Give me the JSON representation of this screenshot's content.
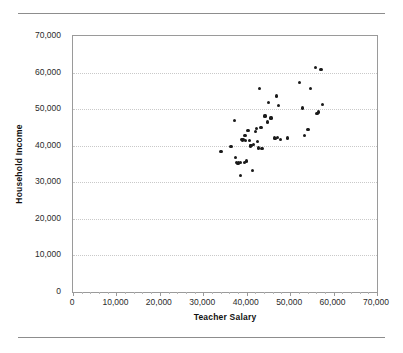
{
  "chart_data": {
    "type": "scatter",
    "title": "",
    "xlabel": "Teacher Salary",
    "ylabel": "Household Income",
    "xlim": [
      0,
      70000
    ],
    "ylim": [
      0,
      70000
    ],
    "xticks": [
      0,
      10000,
      20000,
      30000,
      40000,
      50000,
      60000,
      70000
    ],
    "yticks": [
      0,
      10000,
      20000,
      30000,
      40000,
      50000,
      60000,
      70000
    ],
    "xticklabels": [
      "0",
      "10,000",
      "20,000",
      "30,000",
      "40,000",
      "50,000",
      "60,000",
      "70,000"
    ],
    "yticklabels": [
      "0",
      "10,000",
      "20,000",
      "30,000",
      "40,000",
      "50,000",
      "60,000",
      "70,000"
    ],
    "grid": "horizontal-dotted",
    "legend": null,
    "marker_color": "#1a1a1a",
    "points": [
      {
        "x": 34100,
        "y": 38400
      },
      {
        "x": 36400,
        "y": 39700
      },
      {
        "x": 37100,
        "y": 47000
      },
      {
        "x": 37500,
        "y": 36700
      },
      {
        "x": 37600,
        "y": 35400
      },
      {
        "x": 38000,
        "y": 35200
      },
      {
        "x": 38200,
        "y": 35300
      },
      {
        "x": 38500,
        "y": 35300
      },
      {
        "x": 38600,
        "y": 31800
      },
      {
        "x": 38900,
        "y": 41600
      },
      {
        "x": 39100,
        "y": 41400
      },
      {
        "x": 39300,
        "y": 41700
      },
      {
        "x": 39400,
        "y": 35300
      },
      {
        "x": 39600,
        "y": 42900
      },
      {
        "x": 39800,
        "y": 41500
      },
      {
        "x": 40000,
        "y": 35800
      },
      {
        "x": 40300,
        "y": 44200
      },
      {
        "x": 40600,
        "y": 41400
      },
      {
        "x": 40800,
        "y": 39900
      },
      {
        "x": 41000,
        "y": 40100
      },
      {
        "x": 41300,
        "y": 33200
      },
      {
        "x": 41600,
        "y": 40300
      },
      {
        "x": 42000,
        "y": 43900
      },
      {
        "x": 42300,
        "y": 44700
      },
      {
        "x": 42500,
        "y": 41100
      },
      {
        "x": 42700,
        "y": 39400
      },
      {
        "x": 43000,
        "y": 55600
      },
      {
        "x": 43300,
        "y": 44900
      },
      {
        "x": 43500,
        "y": 39300
      },
      {
        "x": 44200,
        "y": 48100
      },
      {
        "x": 44700,
        "y": 46500
      },
      {
        "x": 45100,
        "y": 51800
      },
      {
        "x": 45600,
        "y": 47600
      },
      {
        "x": 46400,
        "y": 42100
      },
      {
        "x": 46700,
        "y": 41900
      },
      {
        "x": 46900,
        "y": 53600
      },
      {
        "x": 47100,
        "y": 42300
      },
      {
        "x": 47400,
        "y": 50900
      },
      {
        "x": 47800,
        "y": 41800
      },
      {
        "x": 49400,
        "y": 42100
      },
      {
        "x": 52100,
        "y": 57300
      },
      {
        "x": 52900,
        "y": 50300
      },
      {
        "x": 53300,
        "y": 42700
      },
      {
        "x": 54100,
        "y": 44500
      },
      {
        "x": 54600,
        "y": 55700
      },
      {
        "x": 55900,
        "y": 61400
      },
      {
        "x": 56200,
        "y": 48800
      },
      {
        "x": 56600,
        "y": 49200
      },
      {
        "x": 57100,
        "y": 60800
      },
      {
        "x": 57400,
        "y": 51200
      }
    ]
  }
}
